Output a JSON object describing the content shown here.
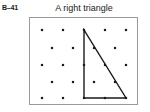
{
  "figure": {
    "exercise_label": "B–41",
    "caption": "A right triangle"
  },
  "geoboard": {
    "panel_border_color": "#9a9a9a",
    "dot_color": "#1a1a1a",
    "shape_stroke_color": "#1a1a1a",
    "rows": 5,
    "pattern": "staggered",
    "dots_per_full_row": 5,
    "dots_per_offset_row": 4,
    "total_dots": 23
  },
  "chart_data": {
    "type": "scatter",
    "title": "A right triangle",
    "xlabel": "",
    "ylabel": "",
    "xlim": [
      0,
      109
    ],
    "ylim": [
      0,
      88
    ],
    "grid": false,
    "legend": null,
    "series": [
      {
        "name": "geoboard-pegs-row-1",
        "x": [
          12,
          33,
          54,
          75,
          96
        ],
        "y": [
          12,
          12,
          12,
          12,
          12
        ]
      },
      {
        "name": "geoboard-pegs-row-2",
        "x": [
          22,
          43,
          64,
          85
        ],
        "y": [
          30,
          30,
          30,
          30
        ]
      },
      {
        "name": "geoboard-pegs-row-3",
        "x": [
          12,
          33,
          54,
          75,
          96
        ],
        "y": [
          47,
          47,
          47,
          47,
          47
        ]
      },
      {
        "name": "geoboard-pegs-row-4",
        "x": [
          22,
          43,
          64,
          85
        ],
        "y": [
          64,
          64,
          64,
          64
        ]
      },
      {
        "name": "geoboard-pegs-row-5",
        "x": [
          12,
          33,
          54,
          75,
          96
        ],
        "y": [
          80,
          80,
          80,
          80,
          80
        ]
      }
    ],
    "annotations": [
      {
        "name": "right-triangle",
        "type": "polygon",
        "closed": true,
        "vertices": [
          {
            "label": "top-vertex",
            "x": 54,
            "y": 12
          },
          {
            "label": "bottom-left-vertex",
            "x": 54,
            "y": 80
          },
          {
            "label": "bottom-right-vertex",
            "x": 96,
            "y": 80
          }
        ],
        "right_angle_at": "bottom-left-vertex"
      }
    ]
  }
}
